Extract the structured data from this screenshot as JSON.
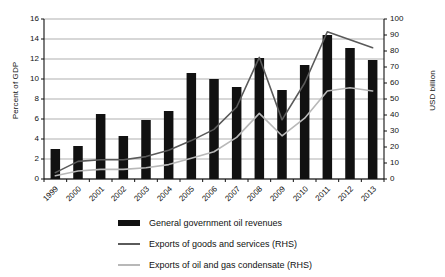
{
  "chart_data": {
    "type": "bar",
    "title": "",
    "xlabel": "",
    "ylabel": "Percent of GDP",
    "ylabel_right": "USD billion",
    "ylim": [
      0,
      16
    ],
    "ylim_right": [
      0,
      100
    ],
    "ytick_step": 2,
    "ytick_step_right": 10,
    "yticks": [
      "16",
      "14",
      "12",
      "10",
      "8",
      "6",
      "4",
      "2",
      "0"
    ],
    "yticks_right": [
      "100",
      "90",
      "80",
      "70",
      "60",
      "50",
      "40",
      "30",
      "20",
      "10",
      "0"
    ],
    "grid": true,
    "legend_position": "bottom",
    "categories": [
      "1999",
      "2000",
      "2001",
      "2002",
      "2003",
      "2004",
      "2005",
      "2006",
      "2007",
      "2008",
      "2009",
      "2010",
      "2011",
      "2012",
      "2013"
    ],
    "series": [
      {
        "name": "General government oil revenues",
        "type": "bar",
        "axis": "left",
        "units": "Percent of GDP",
        "color": "#111111",
        "values": [
          3.0,
          3.3,
          6.5,
          4.3,
          5.9,
          6.8,
          10.6,
          10.0,
          9.2,
          12.1,
          8.9,
          11.4,
          14.4,
          13.1,
          11.9
        ]
      },
      {
        "name": "Exports of goods and services (RHS)",
        "type": "line",
        "axis": "right",
        "units": "USD billion",
        "color": "#5a5a5a",
        "values": [
          4,
          11,
          12,
          12,
          14,
          18,
          24,
          31,
          45,
          76,
          37,
          60,
          92,
          87,
          82
        ]
      },
      {
        "name": "Exports of oil and gas condensate (RHS)",
        "type": "line",
        "axis": "right",
        "units": "USD billion",
        "color": "#b8b8b8",
        "values": [
          2,
          5,
          6,
          6,
          7,
          9,
          13,
          17,
          26,
          41,
          27,
          38,
          55,
          57,
          55
        ]
      }
    ]
  },
  "legend": {
    "items": [
      {
        "label": "General government oil revenues",
        "marker": "bar-swatch",
        "color": "#111111"
      },
      {
        "label": "Exports of goods and services (RHS)",
        "marker": "line-swatch",
        "color": "#5a5a5a"
      },
      {
        "label": "Exports of oil and gas condensate (RHS)",
        "marker": "line-swatch",
        "color": "#b8b8b8"
      }
    ]
  }
}
